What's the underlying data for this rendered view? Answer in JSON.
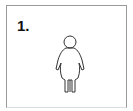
{
  "panel": {
    "label": "1.",
    "figure": "child-outline-icon",
    "stroke_color": "#333333",
    "border_color": "#9a9a9a"
  }
}
